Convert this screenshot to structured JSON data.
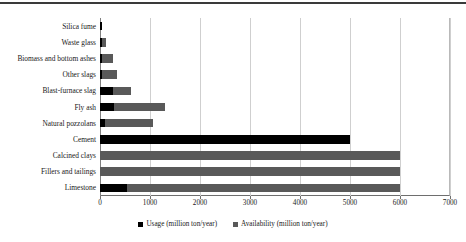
{
  "chart_data": {
    "type": "bar",
    "orientation": "horizontal",
    "title": "",
    "xlabel": "",
    "ylabel": "",
    "xlim": [
      0,
      7000
    ],
    "xticks": [
      0,
      1000,
      2000,
      3000,
      4000,
      5000,
      6000,
      7000
    ],
    "xtick_labels": [
      "0",
      "1000",
      "2000",
      "3000",
      "4000",
      "5000",
      "6000",
      "7000"
    ],
    "grid": true,
    "grid_axis": "x",
    "legend_position": "bottom",
    "categories": [
      "Silica fume",
      "Waste glass",
      "Biomass and bottom ashes",
      "Other slags",
      "Blast-furnace slag",
      "Fly ash",
      "Natural pozzolans",
      "Cement",
      "Calcined clays",
      "Fillers and tailings",
      "Limestone"
    ],
    "series": [
      {
        "name": "Usage (million ton/year)",
        "color": "#000000",
        "values": [
          30,
          30,
          40,
          40,
          250,
          280,
          100,
          5000,
          0,
          0,
          530
        ]
      },
      {
        "name": "Availability (million ton/year)",
        "color": "#595959",
        "values": [
          30,
          110,
          250,
          330,
          620,
          1300,
          1050,
          5000,
          6000,
          6000,
          6000
        ]
      }
    ]
  },
  "legend": {
    "items": [
      {
        "label": "Usage (million ton/year)",
        "color": "#000000"
      },
      {
        "label": "Availability (million ton/year)",
        "color": "#595959"
      }
    ]
  }
}
